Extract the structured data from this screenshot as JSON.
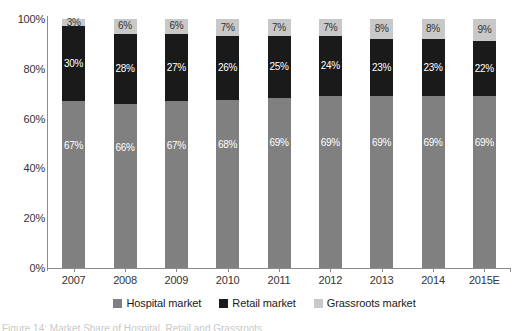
{
  "chart_data": {
    "type": "bar",
    "subtype": "stacked-percentage",
    "title": "",
    "xlabel": "",
    "ylabel": "",
    "ylim": [
      0,
      100
    ],
    "ytick_labels": [
      "0%",
      "20%",
      "40%",
      "60%",
      "80%",
      "100%"
    ],
    "ytick_values": [
      0,
      20,
      40,
      60,
      80,
      100
    ],
    "grid": false,
    "legend_position": "bottom",
    "categories": [
      "2007",
      "2008",
      "2009",
      "2010",
      "2011",
      "2012",
      "2013",
      "2014",
      "2015E"
    ],
    "series": [
      {
        "name": "Hospital market",
        "color": "#808080",
        "values": [
          67,
          66,
          67,
          68,
          69,
          69,
          69,
          69,
          69
        ],
        "labels": [
          "67%",
          "66%",
          "67%",
          "68%",
          "69%",
          "69%",
          "69%",
          "69%",
          "69%"
        ]
      },
      {
        "name": "Retail market",
        "color": "#1a1a1a",
        "values": [
          30,
          28,
          27,
          26,
          25,
          24,
          23,
          23,
          22
        ],
        "labels": [
          "30%",
          "28%",
          "27%",
          "26%",
          "25%",
          "24%",
          "23%",
          "23%",
          "22%"
        ]
      },
      {
        "name": "Grassroots market",
        "color": "#c8c8c8",
        "values": [
          3,
          6,
          6,
          7,
          7,
          7,
          8,
          8,
          9
        ],
        "labels": [
          "3%",
          "6%",
          "6%",
          "7%",
          "7%",
          "7%",
          "8%",
          "8%",
          "9%"
        ]
      }
    ]
  },
  "legend": {
    "items": [
      {
        "label": "Hospital market",
        "color": "#808080"
      },
      {
        "label": "Retail market",
        "color": "#1a1a1a"
      },
      {
        "label": "Grassroots market",
        "color": "#c8c8c8"
      }
    ]
  },
  "caption": {
    "text": "Figure 14: Market Share of Hospital, Retail and Grassroots"
  }
}
